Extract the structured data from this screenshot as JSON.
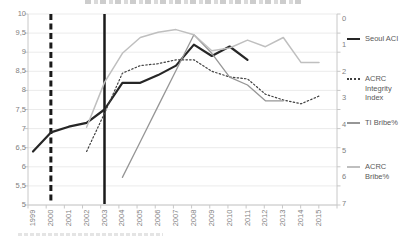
{
  "chart_data": {
    "type": "line",
    "grid": true,
    "cropped_text": {
      "top_title_clipped": true,
      "bottom_caption_clipped": true
    },
    "x_axis": {
      "categories": [
        "1999",
        "2000",
        "2001",
        "2002",
        "2003",
        "2004",
        "2005",
        "2006",
        "2007",
        "2008",
        "2009",
        "2010",
        "2011",
        "2012",
        "2013",
        "2014",
        "2015"
      ]
    },
    "left_axis": {
      "min": 5,
      "max": 10,
      "step": 0.5,
      "labels": [
        "10",
        "9,5",
        "9",
        "8,5",
        "8",
        "7,5",
        "7",
        "6,5",
        "6",
        "5,5",
        "5"
      ]
    },
    "right_axis": {
      "min": 0,
      "max": 7,
      "step": 1,
      "labels": [
        "0",
        "1",
        "2",
        "3",
        "4",
        "5",
        "6",
        "7"
      ]
    },
    "series": [
      {
        "name": "Seoul ACI",
        "axis": "left",
        "style": "solid",
        "color": "#262626",
        "width": 2.2,
        "start_year": 1999,
        "values": [
          6.4,
          6.9,
          7.05,
          7.15,
          7.5,
          8.2,
          8.2,
          8.4,
          8.65,
          9.2,
          8.9,
          9.15,
          8.8
        ]
      },
      {
        "name": "ACRC Integrity Index",
        "axis": "left",
        "style": "dotted",
        "color": "#404040",
        "width": 1.2,
        "start_year": 2002,
        "values": [
          6.4,
          7.4,
          8.45,
          8.65,
          8.7,
          8.8,
          8.8,
          8.5,
          8.35,
          8.3,
          7.9,
          7.75,
          7.65,
          7.85
        ]
      },
      {
        "name": "TI Bribe%",
        "axis": "right",
        "style": "solid",
        "color": "#969696",
        "width": 1.3,
        "start_year": 2004,
        "values": [
          6.0,
          4.65,
          3.3,
          1.95,
          0.6,
          1.3,
          2.2,
          2.5,
          3.1,
          3.1
        ]
      },
      {
        "name": "ACRC Bribe%",
        "axis": "right",
        "style": "solid",
        "color": "#bfbfbf",
        "width": 1.5,
        "start_year": 2002,
        "values": [
          4.1,
          2.4,
          1.3,
          0.7,
          0.5,
          0.4,
          0.6,
          1.2,
          1.1,
          0.8,
          1.05,
          0.7,
          1.65,
          1.65
        ]
      }
    ],
    "annotations": [
      {
        "year": 2000,
        "style": "dashed",
        "color": "#1a1a1a"
      },
      {
        "year": 2003,
        "style": "solid",
        "color": "#1a1a1a"
      }
    ],
    "legend": {
      "position": "right",
      "entries": [
        "Seoul ACI",
        "ACRC Integrity Index",
        "TI Bribe%",
        "ACRC Bribe%"
      ]
    },
    "grid_color": "#ebebeb",
    "axis_line_color": "#c8c8c8"
  }
}
